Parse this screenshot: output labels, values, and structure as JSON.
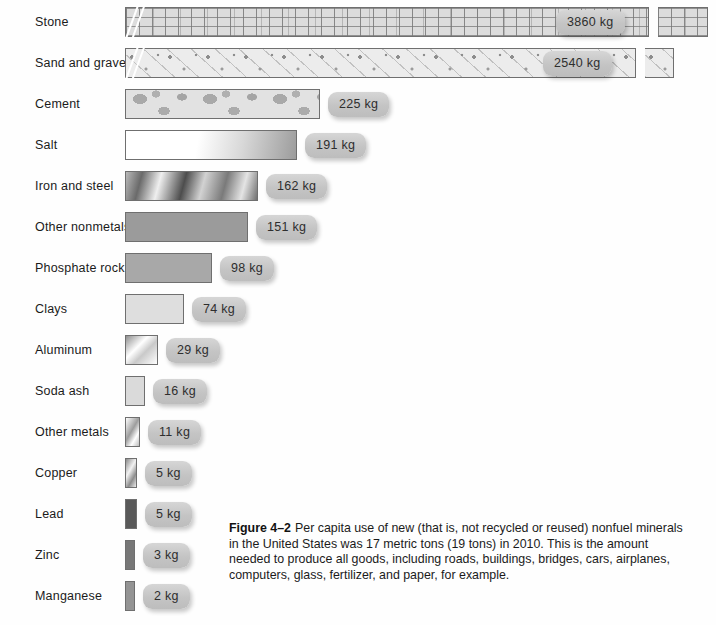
{
  "figure": {
    "number": "Figure 4–2",
    "caption": "Per capita use of new (that is, not recycled or reused) nonfuel minerals in the United States was 17 metric tons (19 tons) in 2010. This is the amount needed to produce all goods, including roads, buildings, bridges, cars, airplanes, computers, glass, fertilizer, and paper, for example."
  },
  "chart_data": {
    "type": "bar",
    "orientation": "horizontal",
    "xlabel": "",
    "ylabel": "",
    "unit": "kg",
    "axis_break": true,
    "axis_break_note": "Top two bars (Stone, Sand and gravel) are drawn with a broken axis",
    "grid": false,
    "legend": "none",
    "categories": [
      "Stone",
      "Sand and gravel",
      "Cement",
      "Salt",
      "Iron and steel",
      "Other nonmetals",
      "Phosphate rock",
      "Clays",
      "Aluminum",
      "Soda ash",
      "Other metals",
      "Copper",
      "Lead",
      "Zinc",
      "Manganese"
    ],
    "values": [
      3860,
      2540,
      225,
      191,
      162,
      151,
      98,
      74,
      29,
      16,
      11,
      5,
      5,
      3,
      2
    ],
    "value_labels": [
      "3860 kg",
      "2540 kg",
      "225 kg",
      "191 kg",
      "162 kg",
      "151 kg",
      "98 kg",
      "74 kg",
      "29 kg",
      "16 kg",
      "11 kg",
      "5 kg",
      "5 kg",
      "3 kg",
      "2 kg"
    ],
    "total_label": "17 metric tons (19 tons)"
  },
  "rows": [
    {
      "label": "Stone",
      "value_label": "3860 kg",
      "top": 22,
      "width": 524,
      "tail": 50,
      "fill": "fill-stone",
      "badge_left": 431,
      "broken": true
    },
    {
      "label": "Sand and gravel",
      "value_label": "2540 kg",
      "top": 63,
      "width": 511,
      "tail": 29,
      "fill": "fill-sand",
      "badge_left": 418,
      "broken": true
    },
    {
      "label": "Cement",
      "value_label": "225 kg",
      "top": 104,
      "width": 195,
      "tail": 0,
      "fill": "fill-cement",
      "badge_left": 0,
      "broken": false
    },
    {
      "label": "Salt",
      "value_label": "191 kg",
      "top": 145,
      "width": 172,
      "tail": 0,
      "fill": "fill-salt",
      "badge_left": 0,
      "broken": false
    },
    {
      "label": "Iron and steel",
      "value_label": "162 kg",
      "top": 186,
      "width": 133,
      "tail": 0,
      "fill": "fill-iron",
      "badge_left": 0,
      "broken": false
    },
    {
      "label": "Other nonmetals",
      "value_label": "151 kg",
      "top": 227,
      "width": 123,
      "tail": 0,
      "fill": "fill-flat-dark",
      "badge_left": 0,
      "broken": false
    },
    {
      "label": "Phosphate rock",
      "value_label": "98 kg",
      "top": 268,
      "width": 87,
      "tail": 0,
      "fill": "fill-flat-mid",
      "badge_left": 0,
      "broken": false
    },
    {
      "label": "Clays",
      "value_label": "74 kg",
      "top": 309,
      "width": 59,
      "tail": 0,
      "fill": "fill-flat-light",
      "badge_left": 0,
      "broken": false
    },
    {
      "label": "Aluminum",
      "value_label": "29 kg",
      "top": 350,
      "width": 33,
      "tail": 0,
      "fill": "fill-alum",
      "badge_left": 0,
      "broken": false
    },
    {
      "label": "Soda ash",
      "value_label": "16 kg",
      "top": 391,
      "width": 20,
      "tail": 0,
      "fill": "fill-soda",
      "badge_left": 0,
      "broken": false
    },
    {
      "label": "Other metals",
      "value_label": "11 kg",
      "top": 432,
      "width": 15,
      "tail": 0,
      "fill": "fill-metal",
      "badge_left": 0,
      "broken": false
    },
    {
      "label": "Copper",
      "value_label": "5 kg",
      "top": 473,
      "width": 12,
      "tail": 0,
      "fill": "fill-copper",
      "badge_left": 0,
      "broken": false
    },
    {
      "label": "Lead",
      "value_label": "5 kg",
      "top": 514,
      "width": 12,
      "tail": 0,
      "fill": "fill-lead",
      "badge_left": 0,
      "broken": false
    },
    {
      "label": "Zinc",
      "value_label": "3 kg",
      "top": 555,
      "width": 10,
      "tail": 0,
      "fill": "fill-zinc",
      "badge_left": 0,
      "broken": false
    },
    {
      "label": "Manganese",
      "value_label": "2 kg",
      "top": 596,
      "width": 10,
      "tail": 0,
      "fill": "fill-mang",
      "badge_left": 0,
      "broken": false
    }
  ]
}
